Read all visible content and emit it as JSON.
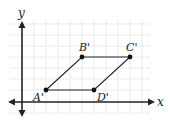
{
  "diagram": {
    "type": "coordinate-plane",
    "axes": {
      "x_label": "x",
      "y_label": "y"
    },
    "grid": {
      "x_min": -1,
      "x_max": 11,
      "y_min": -1,
      "y_max": 7,
      "visible": true
    },
    "shape": "parallelogram",
    "points": [
      {
        "name": "A'",
        "x": 2,
        "y": 1
      },
      {
        "name": "B'",
        "x": 5,
        "y": 4
      },
      {
        "name": "C'",
        "x": 9,
        "y": 4
      },
      {
        "name": "D'",
        "x": 6,
        "y": 1
      }
    ],
    "colors": {
      "line": "#222222",
      "grid": "#d0d0d0",
      "axis": "#222222"
    }
  }
}
